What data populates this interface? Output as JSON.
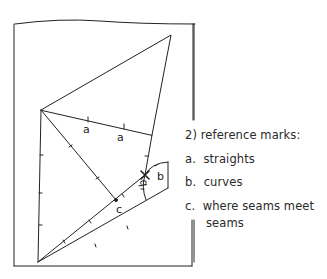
{
  "legend": {
    "heading": "2)  reference marks:",
    "items": [
      {
        "key": "a.",
        "text": "straights"
      },
      {
        "key": "b.",
        "text": "curves"
      },
      {
        "key": "c.",
        "text": "where seams meet"
      }
    ],
    "continuation": "seams"
  },
  "diagram": {
    "labels": {
      "a1": "a",
      "a2": "a",
      "b1": "b",
      "b2": "b",
      "c": "c"
    },
    "stroke_color": "#222222"
  }
}
